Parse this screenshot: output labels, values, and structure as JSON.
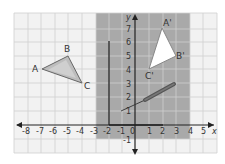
{
  "diagram": {
    "grid": {
      "x_min": -8.5,
      "x_max": 5.5,
      "y_min": -2,
      "y_max": 8,
      "cell_px": 13.5
    },
    "axes": {
      "x_label": "x",
      "y_label": "y"
    },
    "x_ticks": [
      "-8",
      "-7",
      "-6",
      "-5",
      "-4",
      "-3",
      "-2",
      "-1",
      "0",
      "1",
      "2",
      "3",
      "4",
      "5"
    ],
    "y_ticks": [
      "1",
      "2",
      "3",
      "4",
      "5",
      "6",
      "7",
      "-1"
    ],
    "shaded_region": {
      "x_from": -3,
      "x_to": 4,
      "y_from": -1,
      "y_to": 8,
      "color": "#a9a9a9"
    },
    "triangle_original": {
      "vertices": [
        {
          "label": "A",
          "x": -7,
          "y": 4
        },
        {
          "label": "B",
          "x": -5,
          "y": 5
        },
        {
          "label": "C",
          "x": -4,
          "y": 3
        }
      ],
      "fill": "#b8b8b8"
    },
    "triangle_image": {
      "vertices": [
        {
          "label": "A'",
          "x": 2,
          "y": 7
        },
        {
          "label": "B'",
          "x": 3,
          "y": 5
        },
        {
          "label": "C'",
          "x": 1,
          "y": 4
        }
      ],
      "fill": "#ffffff"
    },
    "vertical_bar": {
      "x": -2,
      "y_from": 0,
      "y_to": 6
    },
    "horizontal_bar": {
      "x_from": -2,
      "x_to": 2,
      "y": 0
    },
    "pencil": {
      "from": {
        "x": -1,
        "y": 1
      },
      "to": {
        "x": 3,
        "y": 3
      }
    }
  }
}
